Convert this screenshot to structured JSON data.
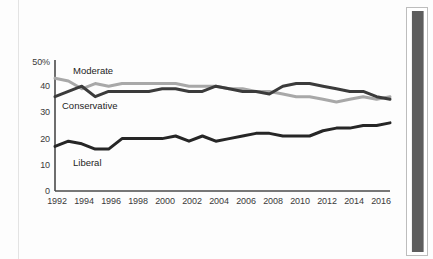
{
  "chart_data": {
    "type": "line",
    "title": "",
    "subtitle": "",
    "xlabel": "",
    "ylabel": "",
    "xlim": [
      1992,
      2017
    ],
    "ylim": [
      0,
      50
    ],
    "grid": false,
    "legend_position": "inline-annotations",
    "y_ticks": [
      "0",
      "10",
      "20",
      "30",
      "40",
      "50%"
    ],
    "y_tick_values": [
      0,
      10,
      20,
      30,
      40,
      50
    ],
    "x_ticks": [
      "1992",
      "1994",
      "1996",
      "1998",
      "2000",
      "2002",
      "2004",
      "2006",
      "2008",
      "2010",
      "2012",
      "2014",
      "2016"
    ],
    "x_tick_values": [
      1992,
      1994,
      1996,
      1998,
      2000,
      2002,
      2004,
      2006,
      2008,
      2010,
      2012,
      2014,
      2016
    ],
    "x": [
      1992,
      1993,
      1994,
      1995,
      1996,
      1997,
      1998,
      1999,
      2000,
      2001,
      2002,
      2003,
      2004,
      2005,
      2006,
      2007,
      2008,
      2009,
      2010,
      2011,
      2012,
      2013,
      2014,
      2015,
      2016,
      2017
    ],
    "series": [
      {
        "name": "Moderate",
        "color": "#a8a8a8",
        "values": [
          43,
          42,
          39,
          41,
          40,
          41,
          41,
          41,
          41,
          41,
          40,
          40,
          40,
          39,
          39,
          38,
          38,
          37,
          36,
          36,
          35,
          34,
          35,
          36,
          35,
          36
        ]
      },
      {
        "name": "Conservative",
        "color": "#3b3b3b",
        "values": [
          36,
          38,
          40,
          36,
          38,
          38,
          38,
          38,
          39,
          39,
          38,
          38,
          40,
          39,
          38,
          38,
          37,
          40,
          41,
          41,
          40,
          39,
          38,
          38,
          36,
          35
        ]
      },
      {
        "name": "Liberal",
        "color": "#262626",
        "values": [
          17,
          19,
          18,
          16,
          16,
          20,
          20,
          20,
          20,
          21,
          19,
          21,
          19,
          20,
          21,
          22,
          22,
          21,
          21,
          21,
          23,
          24,
          24,
          25,
          25,
          26
        ]
      }
    ],
    "annotations": [
      {
        "text": "Moderate",
        "series": "Moderate",
        "x": 1994,
        "y": 46
      },
      {
        "text": "Conservative",
        "series": "Conservative",
        "x": 1993,
        "y": 33
      },
      {
        "text": "Liberal",
        "series": "Liberal",
        "x": 1995,
        "y": 12
      }
    ]
  },
  "axis": {
    "y_50": "50%",
    "y_40": "40",
    "y_30": "30",
    "y_20": "20",
    "y_10": "10",
    "y_0": "0",
    "x_1992": "1992",
    "x_1994": "1994",
    "x_1996": "1996",
    "x_1998": "1998",
    "x_2000": "2000",
    "x_2002": "2002",
    "x_2004": "2004",
    "x_2006": "2006",
    "x_2008": "2008",
    "x_2010": "2010",
    "x_2012": "2012",
    "x_2014": "2014",
    "x_2016": "2016"
  },
  "labels": {
    "moderate": "Moderate",
    "conservative": "Conservative",
    "liberal": "Liberal"
  },
  "colors": {
    "moderate": "#a8a8a8",
    "conservative": "#3b3b3b",
    "liberal": "#262626",
    "axis": "#4a4a4a",
    "frame_bar": "#5d5d5d"
  }
}
